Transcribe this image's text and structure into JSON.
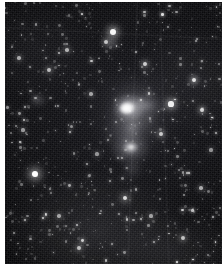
{
  "image": {
    "kind": "astronomical-photograph",
    "subject": "irregular emission nebula with surrounding star field",
    "medium": "black-and-white photographic plate",
    "alt_text": "Grayscale astronomical photograph: a dense field of faint stars on a black sky, with a bright irregular nebula just right of centre.",
    "caption": "",
    "palette": {
      "paper": "#ffffff",
      "sky": "#050505",
      "sky_highlight": "#15151a",
      "star": "#ffffff",
      "nebula_core": "#ffffff",
      "nebula_halo": "#cdcdd2"
    },
    "frame": {
      "width_px": 222,
      "height_px": 270,
      "margin_left_px": 5,
      "margin_top_px": 2,
      "margin_bottom_px": 6,
      "margin_right_px": 0
    }
  },
  "chart_data": {
    "type": "scatter",
    "title": "",
    "xlabel": "",
    "ylabel": "",
    "grid": false,
    "legend": null,
    "xlim": [
      0,
      217
    ],
    "ylim": [
      0,
      262
    ],
    "note": "Point list gives star positions in field pixel coordinates with apparent size and brightness (0-1).",
    "series": [
      {
        "name": "nebula",
        "points": [
          {
            "x": 32,
            "y": 42,
            "r": 13.0,
            "b": 0.95,
            "label": "bright core"
          },
          {
            "x": 36,
            "y": 60,
            "r": 9.0,
            "b": 0.7,
            "label": "south knot"
          },
          {
            "x": 45,
            "y": 36,
            "r": 11.0,
            "b": 0.45,
            "label": "east arm"
          },
          {
            "x": 28,
            "y": 78,
            "r": 10.0,
            "b": 0.28,
            "label": "southern tail"
          }
        ]
      },
      {
        "name": "stars",
        "points": [
          {
            "x": 30,
            "y": 172,
            "r": 3.4,
            "b": 1.0
          },
          {
            "x": 108,
            "y": 30,
            "r": 3.0,
            "b": 0.96
          },
          {
            "x": 101,
            "y": 40,
            "r": 2.0,
            "b": 0.72
          },
          {
            "x": 166,
            "y": 102,
            "r": 2.6,
            "b": 0.92
          },
          {
            "x": 189,
            "y": 78,
            "r": 2.2,
            "b": 0.86
          },
          {
            "x": 197,
            "y": 108,
            "r": 2.0,
            "b": 0.8
          },
          {
            "x": 140,
            "y": 62,
            "r": 2.0,
            "b": 0.78
          },
          {
            "x": 156,
            "y": 132,
            "r": 2.0,
            "b": 0.76
          },
          {
            "x": 44,
            "y": 68,
            "r": 2.0,
            "b": 0.7
          },
          {
            "x": 62,
            "y": 48,
            "r": 1.8,
            "b": 0.66
          },
          {
            "x": 14,
            "y": 56,
            "r": 1.8,
            "b": 0.62
          },
          {
            "x": 86,
            "y": 92,
            "r": 1.8,
            "b": 0.6
          },
          {
            "x": 120,
            "y": 196,
            "r": 2.4,
            "b": 0.84
          },
          {
            "x": 178,
            "y": 236,
            "r": 2.0,
            "b": 0.72
          },
          {
            "x": 74,
            "y": 246,
            "r": 2.0,
            "b": 0.7
          },
          {
            "x": 196,
            "y": 186,
            "r": 1.8,
            "b": 0.64
          },
          {
            "x": 54,
            "y": 214,
            "r": 1.8,
            "b": 0.6
          },
          {
            "x": 146,
            "y": 214,
            "r": 1.6,
            "b": 0.58
          },
          {
            "x": 18,
            "y": 128,
            "r": 1.6,
            "b": 0.56
          },
          {
            "x": 92,
            "y": 152,
            "r": 1.6,
            "b": 0.54
          },
          {
            "x": 206,
            "y": 148,
            "r": 1.6,
            "b": 0.52
          },
          {
            "x": 66,
            "y": 124,
            "r": 1.5,
            "b": 0.5
          }
        ]
      }
    ]
  }
}
